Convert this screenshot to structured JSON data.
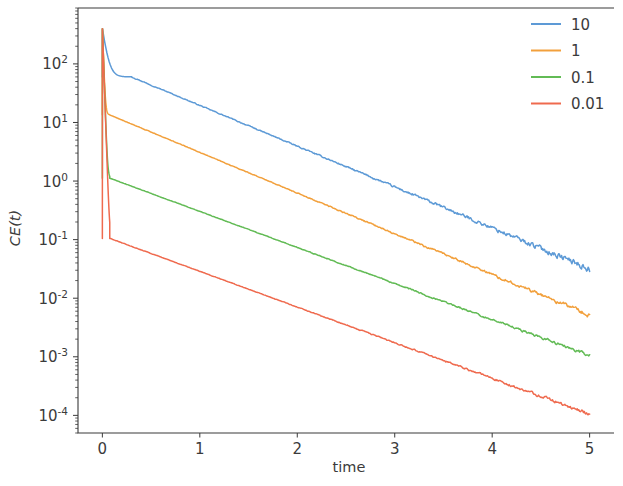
{
  "chart_data": {
    "type": "line",
    "title": "",
    "xlabel": "time",
    "ylabel": "CE(t)",
    "yscale": "log",
    "xscale": "linear",
    "xlim": [
      -0.25,
      5.25
    ],
    "ylim": [
      5e-05,
      900
    ],
    "xticks": [
      0,
      1,
      2,
      3,
      4,
      5
    ],
    "xtick_labels": [
      "0",
      "1",
      "2",
      "3",
      "4",
      "5"
    ],
    "yticks": [
      100,
      10,
      1,
      0.1,
      0.01,
      0.001,
      0.0001
    ],
    "ytick_labels": [
      "10^2",
      "10^1",
      "10^0",
      "10^-1",
      "10^-2",
      "10^-3",
      "10^-4"
    ],
    "ytick_mantissa": "10",
    "ytick_exponents": [
      "2",
      "1",
      "0",
      "-1",
      "-2",
      "-3",
      "-4"
    ],
    "grid": false,
    "legend_position": "upper right",
    "legend_frame": false,
    "series": [
      {
        "name": "10",
        "color": "#5d9ad6",
        "peak": 400,
        "plateau": 60,
        "decay_rate": 1.07,
        "noise": 0.045,
        "end_value": 0.032
      },
      {
        "name": "1",
        "color": "#f2a03c",
        "peak": 400,
        "plateau": 13.5,
        "decay_rate": 1.53,
        "noise": 0.03,
        "end_value": 0.0052
      },
      {
        "name": "0.1",
        "color": "#62bb55",
        "peak": 400,
        "plateau": 1.12,
        "decay_rate": 1.4,
        "noise": 0.022,
        "end_value": 0.00105
      },
      {
        "name": "0.01",
        "color": "#ef6a4e",
        "peak": 400,
        "plateau": 0.105,
        "decay_rate": 1.39,
        "noise": 0.024,
        "end_value": 0.000105
      }
    ]
  },
  "legend": {
    "entries": [
      {
        "label": "10",
        "color": "#5d9ad6"
      },
      {
        "label": "1",
        "color": "#f2a03c"
      },
      {
        "label": "0.1",
        "color": "#62bb55"
      },
      {
        "label": "0.01",
        "color": "#ef6a4e"
      }
    ]
  },
  "axes": {
    "x_axis_label": "time",
    "y_axis_label": "CE(t)"
  }
}
